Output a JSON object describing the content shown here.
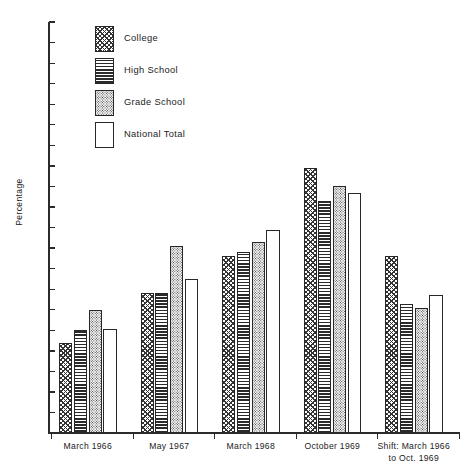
{
  "chart_data": {
    "type": "bar",
    "title": "",
    "xlabel": "",
    "ylabel": "Percentage",
    "ylim": [
      0,
      100
    ],
    "ytick_step": 5,
    "grid": false,
    "legend_position": "top-left",
    "categories": [
      "March 1966",
      "May 1967",
      "March 1968",
      "October 1969",
      "Shift: March 1966 to Oct. 1969"
    ],
    "category_lines": [
      [
        "March 1966"
      ],
      [
        "May 1967"
      ],
      [
        "March 1968"
      ],
      [
        "October 1969"
      ],
      [
        "Shift: March 1966",
        "to Oct. 1969"
      ]
    ],
    "series": [
      {
        "name": "College",
        "pattern": "cross-hatch",
        "values": [
          22,
          34,
          43,
          64.5,
          43
        ]
      },
      {
        "name": "High School",
        "pattern": "horizontal-lines",
        "values": [
          25,
          34,
          44,
          56.5,
          31.5
        ]
      },
      {
        "name": "Grade School",
        "pattern": "stipple-dots",
        "values": [
          30,
          45.5,
          46.5,
          60,
          30.5
        ]
      },
      {
        "name": "National Total",
        "pattern": "solid-white",
        "values": [
          25.2,
          37.5,
          49.5,
          58.5,
          33.5
        ]
      }
    ],
    "ytick_labels": [
      "0",
      "5",
      "10",
      "15",
      "20",
      "25",
      "30",
      "35",
      "40",
      "45",
      "50",
      "55",
      "60",
      "65",
      "70",
      "75",
      "80",
      "85",
      "90",
      "95",
      "100"
    ]
  },
  "legend": {
    "items": [
      {
        "label": "College",
        "series_index": 0
      },
      {
        "label": "High School",
        "series_index": 1
      },
      {
        "label": "Grade School",
        "series_index": 2
      },
      {
        "label": "National Total",
        "series_index": 3
      }
    ]
  },
  "colors": {
    "axis": "#2b2b2b",
    "bar_outline": "#272727",
    "text": "#1c1c1c",
    "background": "#ffffff"
  }
}
